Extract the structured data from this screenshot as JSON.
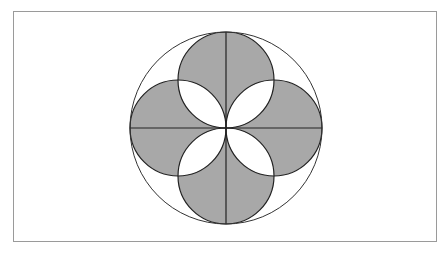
{
  "diagram": {
    "type": "geometric-figure",
    "colors": {
      "background": "#ffffff",
      "frame_stroke": "#9a9a9a",
      "shape_fill": "#a8a8a8",
      "lens_fill": "#ffffff",
      "line_stroke": "#222222"
    },
    "frame": {
      "x": 13,
      "y": 11,
      "width": 423,
      "height": 230
    },
    "outer_circle": {
      "cx": 226,
      "cy": 128,
      "r": 96
    },
    "inner_circles": [
      {
        "name": "top",
        "cx": 226,
        "cy": 80,
        "r": 48
      },
      {
        "name": "bottom",
        "cx": 226,
        "cy": 176,
        "r": 48
      },
      {
        "name": "left",
        "cx": 178,
        "cy": 128,
        "r": 48
      },
      {
        "name": "right",
        "cx": 274,
        "cy": 128,
        "r": 48
      }
    ],
    "diameters": [
      {
        "name": "vertical",
        "x1": 226,
        "y1": 32,
        "x2": 226,
        "y2": 224
      },
      {
        "name": "horizontal",
        "x1": 130,
        "y1": 128,
        "x2": 322,
        "y2": 128
      }
    ]
  }
}
